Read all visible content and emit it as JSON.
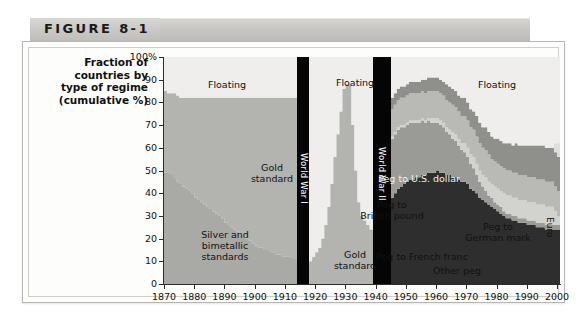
{
  "figure": {
    "label": "FIGURE 8-1"
  },
  "axis": {
    "title": "Fraction of\ncountries by\ntype of regime\n(cumulative %)",
    "y_ticks": [
      "100%",
      "90",
      "80",
      "70",
      "60",
      "50",
      "40",
      "30",
      "20",
      "10",
      "0"
    ],
    "x_ticks": [
      "1870",
      "1880",
      "1890",
      "1900",
      "1910",
      "1920",
      "1930",
      "1940",
      "1950",
      "1960",
      "1970",
      "1980",
      "1990",
      "2000"
    ]
  },
  "labels": {
    "floating_early": "Floating",
    "floating_interwar": "Floating",
    "floating_late": "Floating",
    "gold_standard_early": "Gold\nstandard",
    "gold_standard_interwar": "Gold\nstandard",
    "silver_bimetallic": "Silver and\nbimetallic\nstandards",
    "peg_us_dollar": "Peg to U.S. dollar",
    "peg_british_pound": "Peg to\nBritish pound",
    "peg_german_mark": "Peg to\nGerman mark",
    "peg_french_franc": "Peg to French franc",
    "other_peg": "Other peg",
    "euro": "Euro",
    "world_war_1": "World War I",
    "world_war_2": "World War II"
  },
  "colors": {
    "floating": "#efeeec",
    "gold_standard": "#b3b3b0",
    "silver_bimetallic": "#a9a9a6",
    "peg_us_dollar": "#2e2e2e",
    "peg_british_pound": "#9a9a97",
    "peg_german_mark": "#d2d2cf",
    "peg_french_franc": "#b9b9b6",
    "other_peg": "#8f8f8c",
    "euro": "#dedddb",
    "war_band": "#050505",
    "plot_background": "#eeeeec",
    "axis": "#2b2b2b"
  },
  "chart_data": {
    "type": "area",
    "title": "FIGURE 8-1",
    "xlabel": "",
    "ylabel": "Fraction of countries by type of regime (cumulative %)",
    "xlim": [
      1870,
      2001
    ],
    "ylim": [
      0,
      100
    ],
    "grid": false,
    "legend": "in-plot annotations",
    "stacking": "cumulative percent, bottom-up",
    "annotations": [
      {
        "text": "World War I",
        "type": "vertical-band",
        "x_range": [
          1914,
          1918
        ]
      },
      {
        "text": "World War II",
        "type": "vertical-band",
        "x_range": [
          1939,
          1945
        ]
      }
    ],
    "x": [
      1870,
      1871,
      1872,
      1873,
      1874,
      1875,
      1876,
      1877,
      1878,
      1879,
      1880,
      1881,
      1882,
      1883,
      1884,
      1885,
      1886,
      1887,
      1888,
      1889,
      1890,
      1891,
      1892,
      1893,
      1894,
      1895,
      1896,
      1897,
      1898,
      1899,
      1900,
      1901,
      1902,
      1903,
      1904,
      1905,
      1906,
      1907,
      1908,
      1909,
      1910,
      1911,
      1912,
      1913,
      1918,
      1919,
      1920,
      1921,
      1922,
      1923,
      1924,
      1925,
      1926,
      1927,
      1928,
      1929,
      1930,
      1931,
      1932,
      1933,
      1934,
      1935,
      1936,
      1937,
      1938,
      1945,
      1946,
      1947,
      1948,
      1949,
      1950,
      1951,
      1952,
      1953,
      1954,
      1955,
      1956,
      1957,
      1958,
      1959,
      1960,
      1961,
      1962,
      1963,
      1964,
      1965,
      1966,
      1967,
      1968,
      1969,
      1970,
      1971,
      1972,
      1973,
      1974,
      1975,
      1976,
      1977,
      1978,
      1979,
      1980,
      1981,
      1982,
      1983,
      1984,
      1985,
      1986,
      1987,
      1988,
      1989,
      1990,
      1991,
      1992,
      1993,
      1994,
      1995,
      1996,
      1997,
      1998,
      1999,
      2000,
      2001
    ],
    "series": [
      {
        "name": "Silver and bimetallic standards",
        "order": 1,
        "values": [
          49,
          49,
          48,
          47,
          45,
          44,
          43,
          42,
          41,
          40,
          38,
          37,
          36,
          35,
          34,
          33,
          32,
          31,
          30,
          29,
          27,
          26,
          25,
          24,
          23,
          22,
          21,
          20,
          19,
          18,
          17,
          16,
          16,
          15,
          15,
          14,
          14,
          13,
          13,
          12,
          12,
          12,
          11,
          11,
          0,
          0,
          0,
          0,
          0,
          0,
          0,
          0,
          0,
          0,
          0,
          0,
          0,
          0,
          0,
          0,
          0,
          0,
          0,
          0,
          0,
          0,
          0,
          0,
          0,
          0,
          0,
          0,
          0,
          0,
          0,
          0,
          0,
          0,
          0,
          0,
          0,
          0,
          0,
          0,
          0,
          0,
          0,
          0,
          0,
          0,
          0,
          0,
          0,
          0,
          0,
          0,
          0,
          0,
          0,
          0,
          0,
          0,
          0,
          0,
          0,
          0,
          0,
          0,
          0,
          0,
          0,
          0,
          0,
          0,
          0,
          0,
          0,
          0,
          0,
          0,
          0,
          0
        ]
      },
      {
        "name": "Gold standard",
        "order": 2,
        "values": [
          36,
          35,
          36,
          37,
          38,
          38,
          39,
          40,
          41,
          42,
          44,
          45,
          46,
          47,
          48,
          49,
          50,
          51,
          52,
          53,
          55,
          56,
          57,
          58,
          59,
          60,
          61,
          62,
          63,
          64,
          65,
          66,
          66,
          67,
          67,
          68,
          68,
          69,
          69,
          70,
          70,
          70,
          71,
          71,
          10,
          12,
          14,
          16,
          20,
          26,
          34,
          44,
          56,
          66,
          76,
          86,
          88,
          88,
          70,
          50,
          36,
          30,
          28,
          26,
          24,
          0,
          0,
          0,
          0,
          0,
          0,
          0,
          0,
          0,
          0,
          0,
          0,
          0,
          0,
          0,
          0,
          0,
          0,
          0,
          0,
          0,
          0,
          0,
          0,
          0,
          0,
          0,
          0,
          0,
          0,
          0,
          0,
          0,
          0,
          0,
          0,
          0,
          0,
          0,
          0,
          0,
          0,
          0,
          0,
          0,
          0,
          0,
          0,
          0,
          0,
          0,
          0,
          0,
          0,
          0,
          0,
          0
        ]
      },
      {
        "name": "Peg to U.S. dollar",
        "order": 3,
        "values": [
          0,
          0,
          0,
          0,
          0,
          0,
          0,
          0,
          0,
          0,
          0,
          0,
          0,
          0,
          0,
          0,
          0,
          0,
          0,
          0,
          0,
          0,
          0,
          0,
          0,
          0,
          0,
          0,
          0,
          0,
          0,
          0,
          0,
          0,
          0,
          0,
          0,
          0,
          0,
          0,
          0,
          0,
          0,
          0,
          0,
          0,
          0,
          0,
          0,
          0,
          0,
          0,
          0,
          0,
          0,
          0,
          0,
          0,
          0,
          0,
          0,
          0,
          0,
          0,
          0,
          38,
          40,
          42,
          43,
          44,
          45,
          46,
          46,
          47,
          47,
          48,
          48,
          49,
          49,
          49,
          50,
          49,
          49,
          48,
          48,
          47,
          47,
          46,
          45,
          45,
          44,
          42,
          41,
          40,
          38,
          37,
          36,
          35,
          34,
          33,
          32,
          31,
          30,
          29,
          29,
          28,
          28,
          27,
          27,
          27,
          26,
          26,
          26,
          25,
          25,
          25,
          24,
          24,
          24,
          24,
          24,
          24
        ]
      },
      {
        "name": "Peg to British pound",
        "order": 4,
        "values": [
          0,
          0,
          0,
          0,
          0,
          0,
          0,
          0,
          0,
          0,
          0,
          0,
          0,
          0,
          0,
          0,
          0,
          0,
          0,
          0,
          0,
          0,
          0,
          0,
          0,
          0,
          0,
          0,
          0,
          0,
          0,
          0,
          0,
          0,
          0,
          0,
          0,
          0,
          0,
          0,
          0,
          0,
          0,
          0,
          0,
          0,
          0,
          0,
          0,
          0,
          0,
          0,
          0,
          0,
          0,
          0,
          0,
          0,
          0,
          0,
          0,
          0,
          0,
          0,
          0,
          26,
          26,
          26,
          26,
          25,
          25,
          25,
          25,
          24,
          24,
          24,
          23,
          23,
          22,
          22,
          21,
          21,
          20,
          19,
          18,
          17,
          16,
          15,
          14,
          13,
          12,
          11,
          10,
          8,
          7,
          6,
          5,
          4,
          4,
          3,
          3,
          3,
          2,
          2,
          2,
          2,
          2,
          2,
          2,
          2,
          2,
          2,
          2,
          2,
          2,
          2,
          2,
          2,
          2,
          2,
          2,
          2
        ]
      },
      {
        "name": "Peg to German mark",
        "order": 5,
        "values": [
          0,
          0,
          0,
          0,
          0,
          0,
          0,
          0,
          0,
          0,
          0,
          0,
          0,
          0,
          0,
          0,
          0,
          0,
          0,
          0,
          0,
          0,
          0,
          0,
          0,
          0,
          0,
          0,
          0,
          0,
          0,
          0,
          0,
          0,
          0,
          0,
          0,
          0,
          0,
          0,
          0,
          0,
          0,
          0,
          0,
          0,
          0,
          0,
          0,
          0,
          0,
          0,
          0,
          0,
          0,
          0,
          0,
          0,
          0,
          0,
          0,
          0,
          0,
          0,
          0,
          1,
          1,
          1,
          1,
          1,
          1,
          1,
          1,
          1,
          1,
          1,
          1,
          1,
          2,
          2,
          2,
          2,
          2,
          2,
          2,
          3,
          3,
          3,
          3,
          4,
          4,
          4,
          5,
          5,
          5,
          5,
          6,
          6,
          6,
          7,
          7,
          7,
          8,
          8,
          8,
          8,
          8,
          8,
          8,
          8,
          8,
          8,
          8,
          8,
          8,
          8,
          8,
          8,
          8,
          6,
          4,
          3
        ]
      },
      {
        "name": "Peg to French franc",
        "order": 6,
        "values": [
          0,
          0,
          0,
          0,
          0,
          0,
          0,
          0,
          0,
          0,
          0,
          0,
          0,
          0,
          0,
          0,
          0,
          0,
          0,
          0,
          0,
          0,
          0,
          0,
          0,
          0,
          0,
          0,
          0,
          0,
          0,
          0,
          0,
          0,
          0,
          0,
          0,
          0,
          0,
          0,
          0,
          0,
          0,
          0,
          0,
          0,
          0,
          0,
          0,
          0,
          0,
          0,
          0,
          0,
          0,
          0,
          0,
          0,
          0,
          0,
          0,
          0,
          0,
          0,
          0,
          12,
          12,
          12,
          12,
          12,
          12,
          12,
          12,
          12,
          12,
          12,
          12,
          12,
          12,
          12,
          12,
          12,
          12,
          12,
          12,
          12,
          12,
          12,
          12,
          12,
          12,
          12,
          12,
          12,
          12,
          12,
          12,
          12,
          11,
          11,
          11,
          11,
          11,
          11,
          11,
          11,
          11,
          11,
          11,
          11,
          11,
          11,
          11,
          11,
          11,
          11,
          11,
          11,
          11,
          11,
          11,
          10
        ]
      },
      {
        "name": "Other peg",
        "order": 7,
        "values": [
          0,
          0,
          0,
          0,
          0,
          0,
          0,
          0,
          0,
          0,
          0,
          0,
          0,
          0,
          0,
          0,
          0,
          0,
          0,
          0,
          0,
          0,
          0,
          0,
          0,
          0,
          0,
          0,
          0,
          0,
          0,
          0,
          0,
          0,
          0,
          0,
          0,
          0,
          0,
          0,
          0,
          0,
          0,
          0,
          0,
          0,
          0,
          0,
          0,
          0,
          0,
          0,
          0,
          0,
          0,
          0,
          0,
          0,
          0,
          0,
          0,
          0,
          0,
          0,
          0,
          5,
          5,
          5,
          5,
          5,
          5,
          5,
          5,
          5,
          5,
          5,
          6,
          6,
          6,
          6,
          6,
          6,
          6,
          7,
          7,
          7,
          7,
          7,
          8,
          8,
          8,
          8,
          8,
          9,
          9,
          9,
          10,
          10,
          10,
          10,
          11,
          11,
          11,
          12,
          12,
          12,
          13,
          13,
          13,
          13,
          14,
          14,
          14,
          15,
          15,
          15,
          15,
          15,
          15,
          15,
          15,
          15
        ]
      },
      {
        "name": "Euro",
        "order": 8,
        "values": [
          0,
          0,
          0,
          0,
          0,
          0,
          0,
          0,
          0,
          0,
          0,
          0,
          0,
          0,
          0,
          0,
          0,
          0,
          0,
          0,
          0,
          0,
          0,
          0,
          0,
          0,
          0,
          0,
          0,
          0,
          0,
          0,
          0,
          0,
          0,
          0,
          0,
          0,
          0,
          0,
          0,
          0,
          0,
          0,
          0,
          0,
          0,
          0,
          0,
          0,
          0,
          0,
          0,
          0,
          0,
          0,
          0,
          0,
          0,
          0,
          0,
          0,
          0,
          0,
          0,
          0,
          0,
          0,
          0,
          0,
          0,
          0,
          0,
          0,
          0,
          0,
          0,
          0,
          0,
          0,
          0,
          0,
          0,
          0,
          0,
          0,
          0,
          0,
          0,
          0,
          0,
          0,
          0,
          0,
          0,
          0,
          0,
          0,
          0,
          0,
          0,
          0,
          0,
          0,
          0,
          0,
          0,
          0,
          0,
          0,
          0,
          0,
          0,
          0,
          0,
          0,
          0,
          0,
          0,
          4,
          6,
          8
        ]
      },
      {
        "name": "Floating",
        "order": 9,
        "values": [
          15,
          16,
          16,
          16,
          17,
          18,
          18,
          18,
          18,
          18,
          18,
          18,
          18,
          18,
          18,
          18,
          18,
          18,
          18,
          18,
          18,
          18,
          18,
          18,
          18,
          18,
          18,
          18,
          18,
          18,
          18,
          18,
          18,
          18,
          18,
          18,
          18,
          18,
          18,
          18,
          18,
          18,
          18,
          18,
          90,
          88,
          86,
          84,
          80,
          74,
          66,
          56,
          44,
          34,
          24,
          14,
          12,
          12,
          30,
          50,
          64,
          70,
          72,
          74,
          76,
          18,
          16,
          14,
          13,
          13,
          12,
          11,
          11,
          11,
          11,
          10,
          10,
          9,
          9,
          9,
          9,
          10,
          11,
          12,
          13,
          14,
          15,
          17,
          20,
          21,
          22,
          23,
          24,
          26,
          29,
          31,
          31,
          32,
          34,
          36,
          36,
          38,
          38,
          38,
          38,
          39,
          38,
          38,
          39,
          40,
          39,
          39,
          39,
          39,
          39,
          39,
          40,
          40,
          40,
          38,
          39,
          38
        ]
      }
    ]
  }
}
